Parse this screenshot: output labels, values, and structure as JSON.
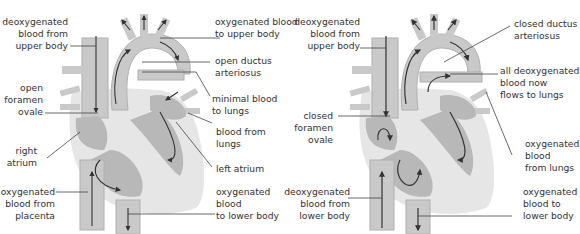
{
  "colors": {
    "outer_tissue": "#e6e6e6",
    "chamber_fill": "#b8b8b8",
    "vessel_fill": "#c9c9c9",
    "vessel_edge": "#9a9a9a",
    "arrow": "#333333",
    "leader_line": "#444444",
    "text": "#333333"
  },
  "fetal": {
    "labels": {
      "deoxy_upper": "deoxygenated\nblood from\nupper body",
      "oxy_upper": "oxygenated blood\nto upper body",
      "ductus": "open ductus\narteriosus",
      "foramen": "open\nforamen\novale",
      "minimal_lungs": "minimal blood\nto lungs",
      "blood_lungs": "blood from\nlungs",
      "right_atrium": "right\natrium",
      "left_atrium": "left atrium",
      "oxy_placenta": "oxygenated\nblood from\nplacenta",
      "oxy_lower": "oxygenated\nblood\nto lower body"
    }
  },
  "newborn": {
    "labels": {
      "deoxy_upper": "deoxygenated\nblood from\nupper body",
      "ductus": "closed ductus\narteriosus",
      "all_deoxy": "all deoxygenated\nblood now\nflows to lungs",
      "foramen": "closed\nforamen\novale",
      "oxy_lungs": "oxygenated\nblood\nfrom lungs",
      "deoxy_lower": "deoxygenated\nblood from\nlower body",
      "oxy_lower": "oxygenated\nblood to\nlower body"
    }
  }
}
